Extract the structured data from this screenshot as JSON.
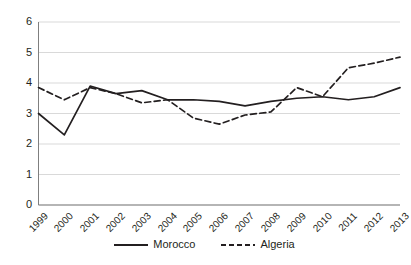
{
  "chart_data": {
    "type": "line",
    "title": "",
    "subtitle": "",
    "xlabel": "",
    "ylabel": "",
    "x": [
      "1999",
      "2000",
      "2001",
      "2002",
      "2003",
      "2004",
      "2005",
      "2006",
      "2007",
      "2008",
      "2009",
      "2010",
      "2011",
      "2012",
      "2013"
    ],
    "categories": [
      "1999",
      "2000",
      "2001",
      "2002",
      "2003",
      "2004",
      "2005",
      "2006",
      "2007",
      "2008",
      "2009",
      "2010",
      "2011",
      "2012",
      "2013"
    ],
    "series": [
      {
        "name": "Morocco",
        "style": "solid",
        "color": "#231f20",
        "values": [
          3.0,
          2.3,
          3.9,
          3.65,
          3.75,
          3.45,
          3.45,
          3.4,
          3.25,
          3.4,
          3.5,
          3.55,
          3.45,
          3.55,
          3.85
        ]
      },
      {
        "name": "Algeria",
        "style": "dashed",
        "color": "#231f20",
        "values": [
          3.85,
          3.45,
          3.85,
          3.65,
          3.35,
          3.45,
          2.85,
          2.65,
          2.95,
          3.05,
          3.85,
          3.55,
          4.5,
          4.65,
          4.85
        ]
      }
    ],
    "ylim": [
      0,
      6
    ],
    "yticks": [
      0,
      1,
      2,
      3,
      4,
      5,
      6
    ],
    "ytick_labels": [
      "0",
      "1",
      "2",
      "3",
      "4",
      "5",
      "6"
    ],
    "grid": "horizontal",
    "grid_color": "#d9d9d9",
    "axis_color": "#808080",
    "legend_position": "bottom",
    "legend": [
      "Morocco",
      "Algeria"
    ],
    "annotations": []
  },
  "axes": {
    "y_labels": [
      "6",
      "5",
      "4",
      "3",
      "2",
      "1",
      "0"
    ],
    "x_labels": [
      "1999",
      "2000",
      "2001",
      "2002",
      "2003",
      "2004",
      "2005",
      "2006",
      "2007",
      "2008",
      "2009",
      "2010",
      "2011",
      "2012",
      "2013"
    ]
  },
  "legend": {
    "entries": [
      {
        "label": "Morocco",
        "style": "solid"
      },
      {
        "label": "Algeria",
        "style": "dashed"
      }
    ]
  },
  "colors": {
    "line": "#231f20",
    "grid": "#d9d9d9",
    "axis": "#7f7f7f",
    "background": "#ffffff"
  }
}
